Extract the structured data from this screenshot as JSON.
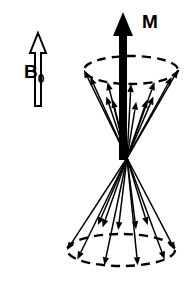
{
  "figure": {
    "background_color": "#ffffff",
    "ink_color": "#000000",
    "width": 185,
    "height": 283
  },
  "labels": {
    "field_label_base": "B",
    "field_label_subscript": "0",
    "magnetization_label": "M"
  },
  "field_arrow": {
    "name": "B0-field-arrow",
    "style": "hollow-outline",
    "direction": "up",
    "tip_x": 38,
    "tip_y": 33,
    "tail_y": 106,
    "shaft_half_width": 3.0,
    "head_half_width": 8.0,
    "head_length": 20
  },
  "magnetization_arrow": {
    "name": "M-net-magnetization-arrow",
    "style": "solid-filled",
    "direction": "up",
    "tip_x": 123,
    "tip_y": 12,
    "tail_y": 160,
    "shaft_half_width": 4.0,
    "head_half_width": 10.0,
    "head_length": 24
  },
  "geometry": {
    "apex_x": 127,
    "apex_y": 158,
    "upper_ellipse": {
      "cx": 131,
      "cy": 70,
      "rx": 47,
      "ry": 14
    },
    "lower_ellipse": {
      "cx": 121,
      "cy": 250,
      "rx": 54,
      "ry": 16
    },
    "dash_pattern": "9 6"
  },
  "chart_data": {
    "type": "scatter",
    "xlabel": "",
    "ylabel": "",
    "annotations": [
      "B0",
      "M"
    ],
    "upper_cone_vectors": [
      {
        "angle_deg": 0,
        "tier": "rim",
        "label": "spin-up-1"
      },
      {
        "angle_deg": 30,
        "tier": "rim",
        "label": "spin-up-2"
      },
      {
        "angle_deg": 60,
        "tier": "rim",
        "label": "spin-up-3"
      },
      {
        "angle_deg": 90,
        "tier": "rim",
        "label": "spin-up-4"
      },
      {
        "angle_deg": 120,
        "tier": "rim",
        "label": "spin-up-5"
      },
      {
        "angle_deg": 150,
        "tier": "rim",
        "label": "spin-up-6"
      },
      {
        "angle_deg": 180,
        "tier": "rim",
        "label": "spin-up-7"
      },
      {
        "angle_deg": 15,
        "tier": "inner",
        "label": "spin-up-8"
      },
      {
        "angle_deg": 45,
        "tier": "inner",
        "label": "spin-up-9"
      },
      {
        "angle_deg": 75,
        "tier": "inner",
        "label": "spin-up-10"
      },
      {
        "angle_deg": 105,
        "tier": "inner",
        "label": "spin-up-11"
      },
      {
        "angle_deg": 135,
        "tier": "inner",
        "label": "spin-up-12"
      },
      {
        "angle_deg": 165,
        "tier": "inner",
        "label": "spin-up-13"
      }
    ],
    "lower_cone_vectors": [
      {
        "angle_deg": 0,
        "tier": "rim",
        "label": "spin-down-1"
      },
      {
        "angle_deg": 36,
        "tier": "rim",
        "label": "spin-down-2"
      },
      {
        "angle_deg": 72,
        "tier": "rim",
        "label": "spin-down-3"
      },
      {
        "angle_deg": 108,
        "tier": "rim",
        "label": "spin-down-4"
      },
      {
        "angle_deg": 144,
        "tier": "rim",
        "label": "spin-down-5"
      },
      {
        "angle_deg": 180,
        "tier": "rim",
        "label": "spin-down-6"
      },
      {
        "angle_deg": 20,
        "tier": "inner",
        "label": "spin-down-7"
      },
      {
        "angle_deg": 60,
        "tier": "inner",
        "label": "spin-down-8"
      },
      {
        "angle_deg": 100,
        "tier": "inner",
        "label": "spin-down-9"
      },
      {
        "angle_deg": 140,
        "tier": "inner",
        "label": "spin-down-10"
      },
      {
        "angle_deg": 160,
        "tier": "inner",
        "label": "spin-down-11"
      }
    ]
  }
}
